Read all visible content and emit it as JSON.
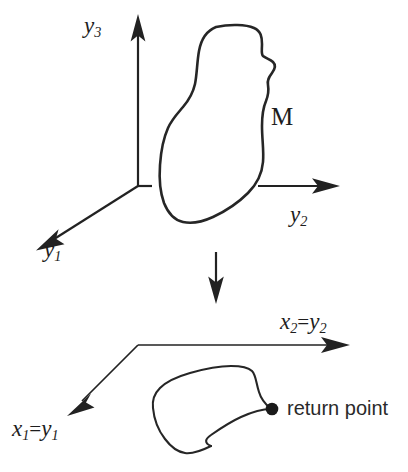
{
  "figure": {
    "kind": "manifold-projection-diagram",
    "background_color": "#ffffff",
    "ink_color": "#222222",
    "width": 408,
    "height": 472
  },
  "upper_panel": {
    "name": "three-dimensional-y-space",
    "axes": [
      {
        "id": "y3",
        "label": "y",
        "subscript": "3",
        "direction": "up"
      },
      {
        "id": "y2",
        "label": "y",
        "subscript": "2",
        "direction": "right"
      },
      {
        "id": "y1",
        "label": "y",
        "subscript": "1",
        "direction": "down-left"
      }
    ],
    "region": {
      "id": "M",
      "label": "M",
      "description": "closed irregular manifold outline"
    }
  },
  "projection_arrow": {
    "name": "downward-projection-arrow",
    "direction": "down"
  },
  "lower_panel": {
    "name": "two-dimensional-x-space",
    "axes": [
      {
        "id": "x2y2",
        "label": "x",
        "subscript": "2",
        "equals": "=",
        "rhs_label": "y",
        "rhs_subscript": "2",
        "direction": "right"
      },
      {
        "id": "x1y1",
        "label": "x",
        "subscript": "1",
        "equals": "=",
        "rhs_label": "y",
        "rhs_subscript": "1",
        "direction": "down-left"
      }
    ],
    "projected_loop": {
      "id": "projected-curve",
      "description": "projected closed loop with cusp"
    },
    "marker": {
      "id": "return-point",
      "label": "return point",
      "dot_color": "#1a1a1a"
    }
  }
}
